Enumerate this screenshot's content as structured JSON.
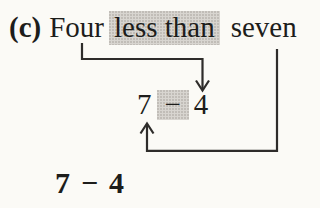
{
  "figure": {
    "part_label": "(c)",
    "phrase": {
      "first_word": "Four",
      "highlighted_words": "less than",
      "last_word": "seven"
    },
    "mapped_expression": {
      "minuend": "7",
      "operator": "−",
      "subtrahend": "4"
    },
    "final_expression": {
      "minuend": "7",
      "operator": "−",
      "subtrahend": "4"
    }
  },
  "icons": {
    "down_elbow_arrow": "arrow from word Four down to numeral 4",
    "up_elbow_arrow": "arrow from word seven down-around-up to numeral 7"
  },
  "colors": {
    "paper": "#fbfaf6",
    "ink": "#1d1d1b",
    "highlight": "#d8d5d0",
    "arrow": "#2e2c2a"
  }
}
